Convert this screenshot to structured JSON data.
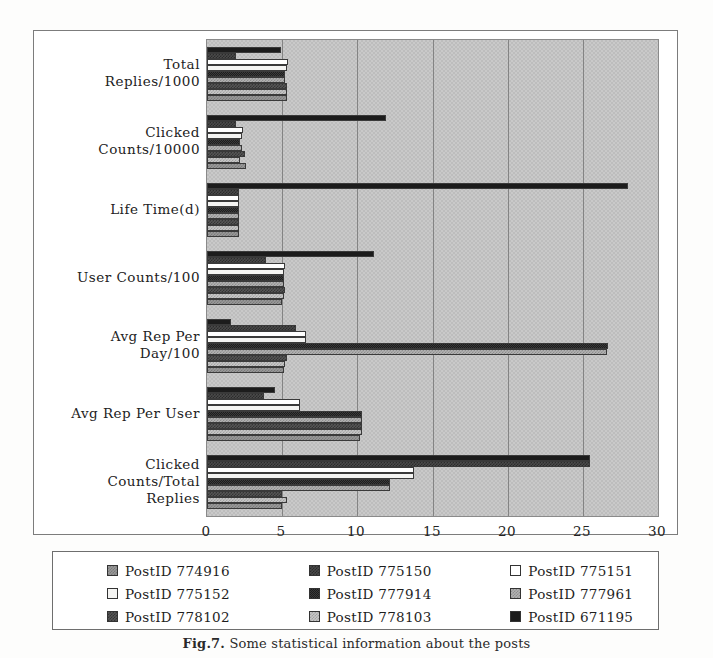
{
  "figure": {
    "caption_label": "Fig.7.",
    "caption_text": "Some statistical information about the posts"
  },
  "axis": {
    "x_ticks": [
      "0",
      "5",
      "10",
      "15",
      "20",
      "25",
      "30"
    ],
    "x_min": 0,
    "x_max": 30
  },
  "legend": {
    "rows": [
      [
        {
          "label": "PostID 774916",
          "pattern": "p0"
        },
        {
          "label": "PostID 775150",
          "pattern": "p1"
        },
        {
          "label": "PostID 775151",
          "pattern": "p2"
        }
      ],
      [
        {
          "label": "PostID 775152",
          "pattern": "p3"
        },
        {
          "label": "PostID 777914",
          "pattern": "p4"
        },
        {
          "label": "PostID 777961",
          "pattern": "p5"
        }
      ],
      [
        {
          "label": "PostID 778102",
          "pattern": "p6"
        },
        {
          "label": "PostID 778103",
          "pattern": "p7"
        },
        {
          "label": "PostID 671195",
          "pattern": "p8"
        }
      ]
    ]
  },
  "chart_data": {
    "type": "bar",
    "orientation": "horizontal",
    "title": "",
    "xlabel": "",
    "ylabel": "",
    "xlim": [
      0,
      30
    ],
    "grid": true,
    "legend_position": "bottom",
    "categories": [
      "Total\nReplies/1000",
      "Clicked\nCounts/10000",
      "Life Time(d)",
      "User Counts/100",
      "Avg Rep Per\nDay/100",
      "Avg Rep Per User",
      "Clicked\nCounts/Total\nReplies"
    ],
    "series": [
      {
        "name": "PostID 774916",
        "pattern": "p0",
        "values": [
          5.3,
          2.6,
          2.1,
          5.0,
          5.1,
          10.2,
          5.0
        ]
      },
      {
        "name": "PostID 778103",
        "pattern": "p7",
        "values": [
          5.3,
          2.2,
          2.1,
          5.1,
          5.2,
          10.3,
          5.3
        ]
      },
      {
        "name": "PostID 778102",
        "pattern": "p6",
        "values": [
          5.3,
          2.5,
          2.1,
          5.2,
          5.3,
          10.3,
          5.0
        ]
      },
      {
        "name": "PostID 777961",
        "pattern": "p5",
        "values": [
          5.2,
          2.3,
          2.1,
          5.1,
          26.6,
          10.3,
          12.2
        ]
      },
      {
        "name": "PostID 777914",
        "pattern": "p4",
        "values": [
          5.2,
          2.2,
          2.1,
          5.1,
          26.7,
          10.3,
          12.2
        ]
      },
      {
        "name": "PostID 775152",
        "pattern": "p3",
        "values": [
          5.3,
          2.3,
          2.1,
          5.1,
          6.6,
          6.2,
          13.8
        ]
      },
      {
        "name": "PostID 775151",
        "pattern": "p2",
        "values": [
          5.4,
          2.4,
          2.1,
          5.2,
          6.6,
          6.2,
          13.8
        ]
      },
      {
        "name": "PostID 775150",
        "pattern": "p1",
        "values": [
          1.9,
          1.9,
          2.1,
          3.9,
          5.9,
          3.8,
          25.5
        ]
      },
      {
        "name": "PostID 671195",
        "pattern": "p8",
        "values": [
          4.9,
          11.9,
          28.0,
          11.1,
          1.6,
          4.5,
          25.5
        ]
      }
    ]
  }
}
